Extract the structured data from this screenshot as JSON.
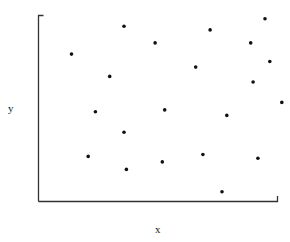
{
  "chart_data": {
    "type": "scatter",
    "title": "",
    "xlabel": "x",
    "ylabel": "y",
    "xlim": [
      0,
      1
    ],
    "ylim": [
      0,
      1
    ],
    "grid": false,
    "legend": null,
    "ticks": "none",
    "marker_color": "#111111",
    "axis_color": "#333333",
    "points": [
      {
        "x": 0.14,
        "y": 0.79
      },
      {
        "x": 0.36,
        "y": 0.94
      },
      {
        "x": 0.3,
        "y": 0.67
      },
      {
        "x": 0.49,
        "y": 0.85
      },
      {
        "x": 0.72,
        "y": 0.92
      },
      {
        "x": 0.95,
        "y": 0.98
      },
      {
        "x": 0.89,
        "y": 0.85
      },
      {
        "x": 0.97,
        "y": 0.75
      },
      {
        "x": 0.66,
        "y": 0.72
      },
      {
        "x": 0.9,
        "y": 0.64
      },
      {
        "x": 0.24,
        "y": 0.48
      },
      {
        "x": 0.53,
        "y": 0.49
      },
      {
        "x": 0.36,
        "y": 0.37
      },
      {
        "x": 0.21,
        "y": 0.24
      },
      {
        "x": 0.37,
        "y": 0.17
      },
      {
        "x": 0.52,
        "y": 0.21
      },
      {
        "x": 0.79,
        "y": 0.46
      },
      {
        "x": 1.02,
        "y": 0.53
      },
      {
        "x": 0.69,
        "y": 0.25
      },
      {
        "x": 0.92,
        "y": 0.23
      },
      {
        "x": 0.77,
        "y": 0.05
      }
    ]
  }
}
